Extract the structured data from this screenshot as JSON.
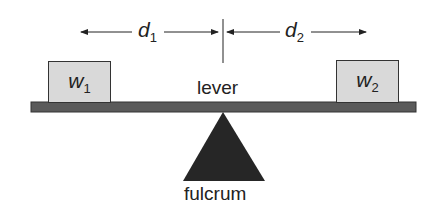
{
  "diagram": {
    "distance_left": {
      "symbol": "d",
      "subscript": "1"
    },
    "distance_right": {
      "symbol": "d",
      "subscript": "2"
    },
    "weight_left": {
      "symbol": "w",
      "subscript": "1"
    },
    "weight_right": {
      "symbol": "w",
      "subscript": "2"
    },
    "lever_label": "lever",
    "fulcrum_label": "fulcrum",
    "colors": {
      "lever": "#5a5a5a",
      "fulcrum": "#262626",
      "weight_box": "#d9d9d9",
      "line": "#222222"
    }
  }
}
